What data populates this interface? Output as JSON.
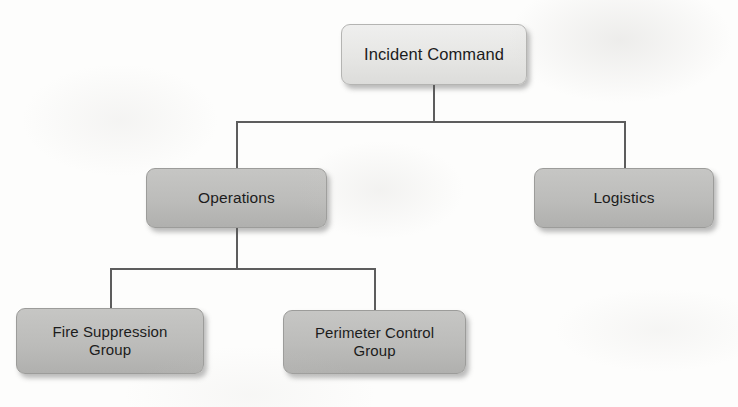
{
  "diagram": {
    "type": "org-chart",
    "background_color": "#fdfdfc",
    "line_color": "#5d5d5d",
    "nodes": [
      {
        "id": "incident-command",
        "label": "Incident Command",
        "level": "root",
        "fill": "#e8e8e6",
        "x": 341,
        "y": 24,
        "w": 186,
        "h": 61
      },
      {
        "id": "operations",
        "label": "Operations",
        "level": "mid",
        "fill": "#bcbcba",
        "x": 146,
        "y": 168,
        "w": 181,
        "h": 60
      },
      {
        "id": "logistics",
        "label": "Logistics",
        "level": "mid",
        "fill": "#bcbcba",
        "x": 534,
        "y": 168,
        "w": 180,
        "h": 60
      },
      {
        "id": "fire-suppression-group",
        "label": "Fire Suppression\nGroup",
        "level": "leaf",
        "fill": "#bcbcba",
        "x": 16,
        "y": 308,
        "w": 188,
        "h": 66
      },
      {
        "id": "perimeter-control-group",
        "label": "Perimeter Control\nGroup",
        "level": "leaf",
        "fill": "#bcbcba",
        "x": 283,
        "y": 310,
        "w": 183,
        "h": 64
      }
    ],
    "edges": [
      {
        "id": "edge-command-to-operations",
        "from": "incident-command",
        "to": "operations"
      },
      {
        "id": "edge-command-to-logistics",
        "from": "incident-command",
        "to": "logistics"
      },
      {
        "id": "edge-operations-to-fire-suppression",
        "from": "operations",
        "to": "fire-suppression-group"
      },
      {
        "id": "edge-operations-to-perimeter-control",
        "from": "operations",
        "to": "perimeter-control-group"
      }
    ]
  }
}
